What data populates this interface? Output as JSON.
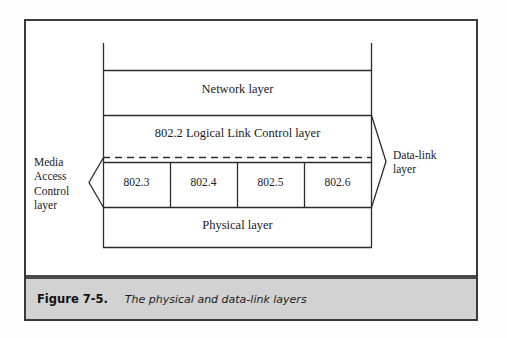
{
  "figure": {
    "caption_number": "Figure 7-5.",
    "caption_text": "The physical and data-link layers",
    "frame_color": "#3a3a3a",
    "caption_bar_color": "#d2d2d2",
    "line_color": "#2c2c2c",
    "background": "#ffffff"
  },
  "diagram": {
    "type": "layered-stack",
    "title": "The physical and data-link layers",
    "layers": [
      {
        "id": "network",
        "label": "Network layer"
      },
      {
        "id": "llc",
        "label": "802.2 Logical Link Control layer"
      },
      {
        "id": "mac",
        "label": ""
      },
      {
        "id": "physical",
        "label": "Physical layer"
      }
    ],
    "mac_sublayers": [
      {
        "label": "802.3"
      },
      {
        "label": "802.4"
      },
      {
        "label": "802.5"
      },
      {
        "label": "802.6"
      }
    ],
    "side_labels": {
      "left": {
        "id": "media-access-control",
        "lines": [
          "Media",
          "Access",
          "Control",
          "layer"
        ],
        "text": "Media\nAccess\nControl\nlayer",
        "brace": "left-chevron",
        "spans": [
          "mac"
        ]
      },
      "right": {
        "id": "data-link",
        "lines": [
          "Data-link",
          "layer"
        ],
        "text": "Data-link\nlayer",
        "brace": "right-chevron",
        "spans": [
          "llc",
          "mac"
        ]
      }
    },
    "dashed_divider": {
      "between": [
        "llc",
        "mac"
      ],
      "style": "dashed"
    },
    "top_ticks": {
      "count": 2,
      "note": "short vertical marks above the Network layer box at its left and right edges"
    }
  }
}
